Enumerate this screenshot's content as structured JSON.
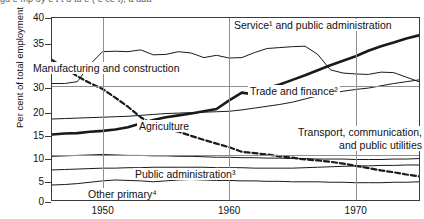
{
  "figure": {
    "caption": "Figure 3  Employment structure in percent, Canada, 1946–1975",
    "caption_visible_fragment": "gu e   mp oy e t   t u tu e  ( e  ce t),  a ada"
  },
  "axes": {
    "y_title": "Per cent of total employment",
    "y_ticks": [
      "40",
      "35",
      "25",
      "30",
      "20",
      "15",
      "10",
      "5",
      "0"
    ],
    "y_tick_values": [
      40,
      35,
      30,
      30,
      20,
      15,
      10,
      5,
      0
    ],
    "y_min": 0,
    "y_max": 40,
    "x_ticks": [
      "1950",
      "1960",
      "1970"
    ],
    "x_tick_values": [
      1950,
      1960,
      1970
    ],
    "x_min": 1946,
    "x_max": 1975
  },
  "annotations": {
    "service": "Service¹ and public administration",
    "manufacturing": "Manufacturing and construction",
    "trade": "Trade and finance²",
    "agriculture": "Agriculture",
    "transport_line1": "Transport, communication,",
    "transport_line2": "and public utilities",
    "public_admin": "Public administration³",
    "other_primary": "Other primary⁴"
  },
  "colors": {
    "ink": "#1a1a1a",
    "frame": "#3a3a3a",
    "grid": "#8f8f8f",
    "paper": "#ffffff"
  },
  "chart_data": {
    "type": "line",
    "xlabel": "",
    "ylabel": "Per cent of total employment",
    "xlim": [
      1946,
      1975
    ],
    "ylim": [
      0,
      40
    ],
    "grid": true,
    "legend": "inline-annotations",
    "x": [
      1946,
      1947,
      1948,
      1949,
      1950,
      1951,
      1952,
      1953,
      1954,
      1955,
      1956,
      1957,
      1958,
      1959,
      1960,
      1961,
      1962,
      1963,
      1964,
      1965,
      1966,
      1967,
      1968,
      1969,
      1970,
      1971,
      1972,
      1973,
      1974,
      1975
    ],
    "series": [
      {
        "name": "Manufacturing and construction",
        "style": "thin-solid",
        "values": [
          25.6,
          25.6,
          26.0,
          29.8,
          32.6,
          32.7,
          32.6,
          33.0,
          31.9,
          32.0,
          32.6,
          32.3,
          31.3,
          31.8,
          31.2,
          31.3,
          32.4,
          33.3,
          33.5,
          33.7,
          33.8,
          32.0,
          28.6,
          27.9,
          27.7,
          27.6,
          28.1,
          28.0,
          27.0,
          26.0
        ]
      },
      {
        "name": "Service¹ and public administration",
        "style": "thick-solid",
        "values": [
          14.4,
          14.6,
          14.7,
          15.0,
          15.2,
          15.5,
          16.0,
          16.8,
          17.6,
          18.2,
          18.6,
          19.0,
          19.5,
          20.0,
          21.9,
          23.6,
          23.2,
          24.6,
          25.4,
          26.4,
          27.4,
          28.5,
          29.6,
          30.6,
          31.6,
          32.8,
          33.8,
          34.6,
          35.5,
          36.2
        ]
      },
      {
        "name": "Trade and finance²",
        "style": "thin-solid",
        "values": [
          17.8,
          17.9,
          18.0,
          18.1,
          18.2,
          18.3,
          18.4,
          18.6,
          18.8,
          19.0,
          19.1,
          19.2,
          19.3,
          19.4,
          19.5,
          19.8,
          20.2,
          20.6,
          21.0,
          21.5,
          22.2,
          22.9,
          23.4,
          23.9,
          24.3,
          24.6,
          25.1,
          25.6,
          26.0,
          26.4
        ]
      },
      {
        "name": "Agriculture",
        "style": "dashed",
        "values": [
          30.8,
          29.0,
          27.2,
          25.7,
          24.4,
          22.5,
          20.5,
          18.2,
          16.6,
          15.6,
          15.0,
          14.1,
          13.2,
          12.4,
          11.6,
          10.6,
          10.3,
          10.0,
          9.6,
          9.3,
          8.9,
          8.7,
          8.4,
          8.0,
          7.5,
          7.0,
          6.5,
          6.1,
          5.6,
          5.2
        ]
      },
      {
        "name": "Transport, communication, and public utilities",
        "style": "thin-solid",
        "values": [
          9.6,
          9.7,
          9.8,
          9.9,
          10.0,
          9.9,
          9.8,
          9.8,
          9.7,
          9.7,
          9.6,
          9.6,
          9.5,
          9.4,
          9.4,
          9.3,
          9.3,
          9.2,
          9.2,
          9.1,
          9.1,
          9.0,
          9.0,
          9.0,
          8.9,
          8.9,
          8.9,
          9.0,
          9.0,
          9.1
        ]
      },
      {
        "name": "Public administration³",
        "style": "thin-solid",
        "values": [
          6.6,
          6.7,
          6.8,
          6.9,
          7.0,
          7.0,
          7.1,
          7.1,
          7.2,
          7.2,
          7.2,
          7.2,
          7.2,
          7.1,
          7.1,
          7.1,
          7.0,
          7.0,
          7.0,
          7.0,
          7.1,
          7.2,
          7.3,
          7.4,
          7.5,
          7.5,
          7.6,
          7.6,
          7.7,
          7.7
        ]
      },
      {
        "name": "Other primary⁴",
        "style": "thin-solid",
        "values": [
          3.3,
          3.4,
          3.6,
          3.9,
          4.2,
          4.4,
          4.3,
          4.2,
          4.0,
          4.2,
          4.4,
          4.5,
          4.4,
          4.3,
          4.3,
          4.2,
          4.2,
          4.1,
          4.1,
          4.0,
          4.0,
          4.0,
          3.9,
          3.9,
          3.8,
          3.8,
          3.8,
          3.9,
          3.9,
          4.0
        ]
      }
    ]
  }
}
